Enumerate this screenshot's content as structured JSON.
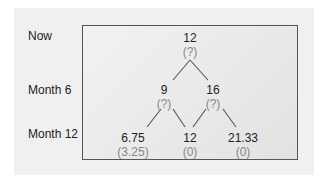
{
  "row_labels": [
    "Now",
    "Month 6",
    "Month 12"
  ],
  "tree": {
    "root": {
      "value": "12",
      "option": "(?)"
    },
    "month6": [
      {
        "value": "9",
        "option": "(?)"
      },
      {
        "value": "16",
        "option": "(?)"
      }
    ],
    "month12": [
      {
        "value": "6.75",
        "option": "(3.25)"
      },
      {
        "value": "12",
        "option": "(0)"
      },
      {
        "value": "21.33",
        "option": "(0)"
      }
    ]
  },
  "colors": {
    "value_text": "#222222",
    "option_text": "#888888",
    "box_border": "#555555"
  }
}
